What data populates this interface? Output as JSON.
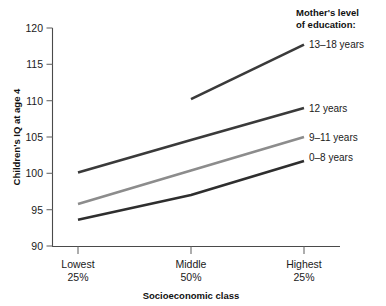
{
  "chart_data": {
    "type": "line",
    "title": "",
    "xlabel": "Socioeconomic class",
    "ylabel": "Children's IQ at age 4",
    "categories": [
      "Lowest 25%",
      "Middle 50%",
      "Highest 25%"
    ],
    "category_lines": [
      {
        "top": "Lowest",
        "bottom": "25%"
      },
      {
        "top": "Middle",
        "bottom": "50%"
      },
      {
        "top": "Highest",
        "bottom": "25%"
      }
    ],
    "ylim": [
      90,
      120
    ],
    "yticks": [
      90,
      95,
      100,
      105,
      110,
      115,
      120
    ],
    "ytick_labels": [
      "90",
      "95",
      "100",
      "105",
      "110",
      "115",
      "120"
    ],
    "grid": false,
    "legend_position": "right",
    "legend_title_lines": [
      "Mother's level",
      "of education:"
    ],
    "series": [
      {
        "name": "13–18 years",
        "label": "13–18 years",
        "color": "#3a3a3a",
        "width": 2.6,
        "x": [
          "Middle 50%",
          "Highest 25%"
        ],
        "values": [
          110.2,
          117.7
        ]
      },
      {
        "name": "12 years",
        "label": "12 years",
        "color": "#3a3a3a",
        "width": 2.6,
        "x": [
          "Lowest 25%",
          "Middle 50%",
          "Highest 25%"
        ],
        "values": [
          100.1,
          104.6,
          109.0
        ]
      },
      {
        "name": "9–11 years",
        "label": "9–11 years",
        "color": "#8c8c8c",
        "width": 2.6,
        "x": [
          "Lowest 25%",
          "Middle 50%",
          "Highest 25%"
        ],
        "values": [
          95.8,
          100.4,
          105.0
        ]
      },
      {
        "name": "0–8 years",
        "label": "0–8 years",
        "color": "#2e2e2e",
        "width": 2.6,
        "x": [
          "Lowest 25%",
          "Middle 50%",
          "Highest 25%"
        ],
        "values": [
          93.6,
          97.0,
          101.7
        ]
      }
    ]
  },
  "axis": {
    "y_title": "Children's IQ at age 4",
    "x_title": "Socioeconomic class",
    "y_tick_0": "90",
    "y_tick_1": "95",
    "y_tick_2": "100",
    "y_tick_3": "105",
    "y_tick_4": "110",
    "y_tick_5": "115",
    "y_tick_6": "120",
    "x_cat_0_top": "Lowest",
    "x_cat_0_bottom": "25%",
    "x_cat_1_top": "Middle",
    "x_cat_1_bottom": "50%",
    "x_cat_2_top": "Highest",
    "x_cat_2_bottom": "25%"
  },
  "legend": {
    "title_line1": "Mother's level",
    "title_line2": "of education:",
    "item_0": "13–18 years",
    "item_1": "12 years",
    "item_2": "9–11 years",
    "item_3": "0–8 years"
  },
  "colors": {
    "dark_line": "#3a3a3a",
    "gray_line": "#8c8c8c",
    "axis": "#4a4a4a",
    "text": "#1a1a1a",
    "background": "#ffffff"
  }
}
